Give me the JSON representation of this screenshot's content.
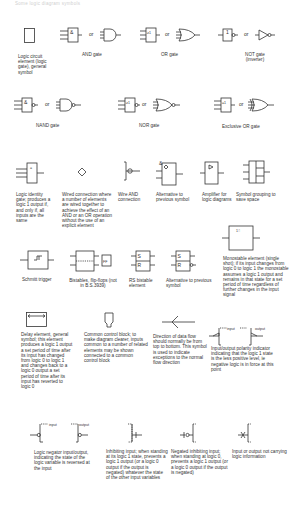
{
  "title": "Some logic diagram symbols",
  "or_label": "or",
  "symbols": [
    {
      "id": "logic-element",
      "caption": "Logic circuit element (logic gate), general symbol"
    },
    {
      "id": "and-gate",
      "caption": "AND gate",
      "box_glyph": "&"
    },
    {
      "id": "or-gate",
      "caption": "OR gate",
      "box_glyph": "≥1"
    },
    {
      "id": "not-gate",
      "caption": "NOT gate (inverter)",
      "box_glyph": "1"
    },
    {
      "id": "nand-gate",
      "caption": "NAND gate",
      "box_glyph": "&"
    },
    {
      "id": "nor-gate",
      "caption": "NOR gate",
      "box_glyph": "≥1"
    },
    {
      "id": "xor-gate",
      "caption": "Exclusive OR gate",
      "box_glyph": "=1"
    },
    {
      "id": "identity-gate",
      "caption": "Logic identity gate; produces a logic 1 output if, and only if, all inputs are the same",
      "box_glyph": "="
    },
    {
      "id": "wired-connection",
      "caption": "Wired connection where a number of elements are wired together to achieve the effect of an AND or an OR operation without the use of an explicit element"
    },
    {
      "id": "wire-and",
      "caption": "Wire AND connection"
    },
    {
      "id": "wire-and-alt",
      "caption": "Alternative to previous symbol",
      "box_glyph": "&"
    },
    {
      "id": "amplifier",
      "caption": "Amplifier for logic diagrams",
      "box_glyph": "▷"
    },
    {
      "id": "symbol-grouping",
      "caption": "Symbol grouping to save space"
    },
    {
      "id": "schmitt-trigger",
      "caption": "Schmitt trigger",
      "box_glyph": "⨅"
    },
    {
      "id": "bistable",
      "caption": "Bistables, flip-flops (not in B.S.3939)",
      "box_glyph": "FF"
    },
    {
      "id": "rs-bistable",
      "caption": "RS bistable element",
      "s_label": "S",
      "r_label": "R"
    },
    {
      "id": "rs-bistable-alt",
      "caption": "Alternative to previous symbol",
      "s_label": "S",
      "r_label": "R"
    },
    {
      "id": "monostable",
      "caption": "Monostable element (single shot); if its input changes from logic 0 to logic 1 the monostable assumes a logic 1 output and remains in that state for a set period of time regardless of further changes in the input signal",
      "box_glyph": "1⎍"
    },
    {
      "id": "delay-element",
      "caption": "Delay element, general symbol; this element produces a logic 1 output a set period of time after its input has changed from logic 0 to logic 1 and changes back to a logic 0 output a set period of time after its input has reverted to logic 0"
    },
    {
      "id": "common-control",
      "caption": "Common control block; to make diagram clearer, inputs common to a number of related elements may be shown connected to a common control block"
    },
    {
      "id": "data-flow",
      "caption": "Direction of data flow should normally be from top to bottom. This symbol is used to indicate exceptions to the normal flow direction"
    },
    {
      "id": "polarity-indicator",
      "caption": "Input/output polarity indicator indicating that the logic 1 state is the less positive level, ie negative logic is in force at this point",
      "input_label": "input",
      "output_label": "output"
    },
    {
      "id": "logic-negator",
      "caption": "Logic negator input/output, indicating the state of the logic variable is reversed at the input",
      "input_label": "input",
      "output_label": "output"
    },
    {
      "id": "inhibiting-input",
      "caption": "Inhibiting input; when standing at its logic 1 state, prevents a logic 1 output (or a logic 0 output if the output is negated) whatever the state of the other input variables"
    },
    {
      "id": "negated-inhibiting-input",
      "caption": "Negated inhibiting input; when standing at logic 0, prevents a logic 1 output (or a logic 0 output if the output is negated)"
    },
    {
      "id": "no-logic-io",
      "caption": "Input or output not carrying logic information"
    }
  ]
}
